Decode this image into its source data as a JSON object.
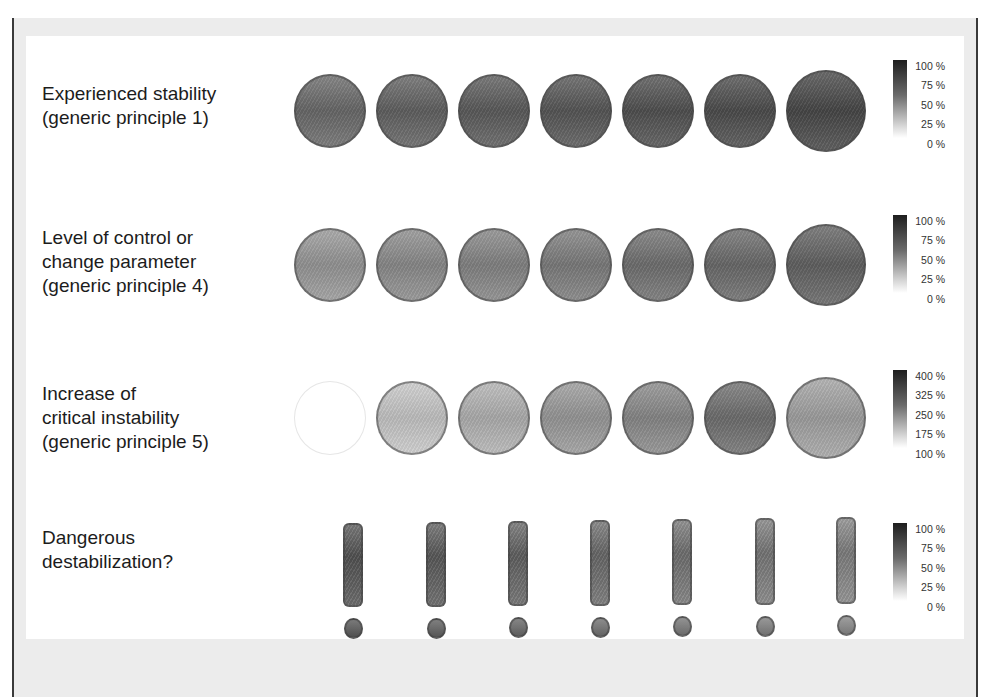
{
  "rows": [
    {
      "label": "Experienced stability\n(generic principle 1)",
      "glyph": "circle",
      "shades": [
        "#6c6c6c",
        "#646464",
        "#5e5e5e",
        "#595959",
        "#535353",
        "#4f4f4f",
        "#4a4a4a"
      ],
      "legend": {
        "ticks": [
          "100 %",
          "75 %",
          "50 %",
          "25 %",
          "0 %"
        ]
      }
    },
    {
      "label": "Level of control or\nchange parameter\n(generic principle 4)",
      "glyph": "circle",
      "shades": [
        "#9a9a9a",
        "#8e8e8e",
        "#878787",
        "#7f7f7f",
        "#737373",
        "#6d6d6d",
        "#656565"
      ],
      "legend": {
        "ticks": [
          "100 %",
          "75 %",
          "50 %",
          "25 %",
          "0 %"
        ]
      }
    },
    {
      "label": "Increase of\ncritical instability\n(generic principle 5)",
      "glyph": "circle",
      "shades": [
        "#ffffff",
        "#c9c9c9",
        "#b4b4b4",
        "#9c9c9c",
        "#8c8c8c",
        "#727272",
        "#a5a5a5"
      ],
      "legend": {
        "ticks": [
          "400 %",
          "325 %",
          "250 %",
          "175 %",
          "100 %"
        ]
      }
    },
    {
      "label": "Dangerous\ndestabilization?",
      "glyph": "exclamation",
      "shades": [
        "#585858",
        "#5f5f5f",
        "#676767",
        "#6f6f6f",
        "#777777",
        "#7e7e7e",
        "#868686"
      ],
      "legend": {
        "ticks": [
          "100 %",
          "75 %",
          "50 %",
          "25 %",
          "0 %"
        ]
      }
    }
  ],
  "colors": {
    "frame": "#ececec",
    "panel": "#ffffff",
    "frame_edge": "#3a3a3a"
  }
}
